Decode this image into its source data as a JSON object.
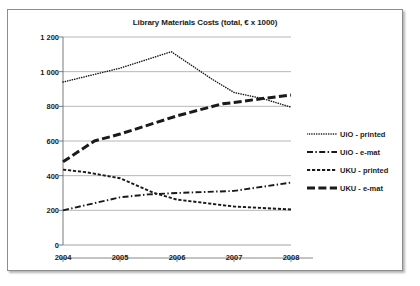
{
  "chart_data": {
    "type": "line",
    "title": "Library Materials Costs (total, € x 1000)",
    "xlabel": "",
    "ylabel": "",
    "categories": [
      "2004",
      "2005",
      "2006",
      "2007",
      "2008"
    ],
    "x": [
      2004,
      2005,
      2006,
      2007,
      2008
    ],
    "ylim": [
      0,
      1200
    ],
    "xlim": [
      2004,
      2008
    ],
    "yticks": [
      "0",
      "200",
      "400",
      "600",
      "800",
      "1 000",
      "1 200"
    ],
    "ytick_values": [
      0,
      200,
      400,
      600,
      800,
      1000,
      1200
    ],
    "grid": "horizontal",
    "legend_position": "right",
    "series": [
      {
        "name": "UiO - printed",
        "style": "dotted",
        "color": "#1a1a1a",
        "values": [
          940,
          1020,
          1115,
          880,
          795
        ],
        "points": [
          {
            "x": 2004,
            "y": 940
          },
          {
            "x": 2005,
            "y": 1020
          },
          {
            "x": 2005.9,
            "y": 1115
          },
          {
            "x": 2006.6,
            "y": 960
          },
          {
            "x": 2007,
            "y": 880
          },
          {
            "x": 2007.5,
            "y": 845
          },
          {
            "x": 2008,
            "y": 795
          }
        ]
      },
      {
        "name": "UiO - e-mat",
        "style": "dash-dot",
        "color": "#1a1a1a",
        "values": [
          200,
          275,
          300,
          312,
          360
        ],
        "points": [
          {
            "x": 2004,
            "y": 200
          },
          {
            "x": 2005,
            "y": 275
          },
          {
            "x": 2005.5,
            "y": 292
          },
          {
            "x": 2006,
            "y": 300
          },
          {
            "x": 2007,
            "y": 312
          },
          {
            "x": 2008,
            "y": 360
          }
        ]
      },
      {
        "name": "UKU - printed",
        "style": "dashed-fine",
        "color": "#1a1a1a",
        "values": [
          435,
          385,
          262,
          222,
          205
        ],
        "points": [
          {
            "x": 2004,
            "y": 435
          },
          {
            "x": 2004.4,
            "y": 420
          },
          {
            "x": 2005,
            "y": 385
          },
          {
            "x": 2005.6,
            "y": 300
          },
          {
            "x": 2006,
            "y": 262
          },
          {
            "x": 2007,
            "y": 222
          },
          {
            "x": 2008,
            "y": 205
          }
        ]
      },
      {
        "name": "UKU - e-mat",
        "style": "dashed-thick",
        "color": "#1a1a1a",
        "values": [
          480,
          640,
          745,
          820,
          865
        ],
        "points": [
          {
            "x": 2004,
            "y": 480
          },
          {
            "x": 2004.55,
            "y": 600
          },
          {
            "x": 2005,
            "y": 640
          },
          {
            "x": 2006,
            "y": 745
          },
          {
            "x": 2006.8,
            "y": 815
          },
          {
            "x": 2007,
            "y": 822
          },
          {
            "x": 2007.5,
            "y": 845
          },
          {
            "x": 2008,
            "y": 865
          }
        ]
      }
    ]
  }
}
